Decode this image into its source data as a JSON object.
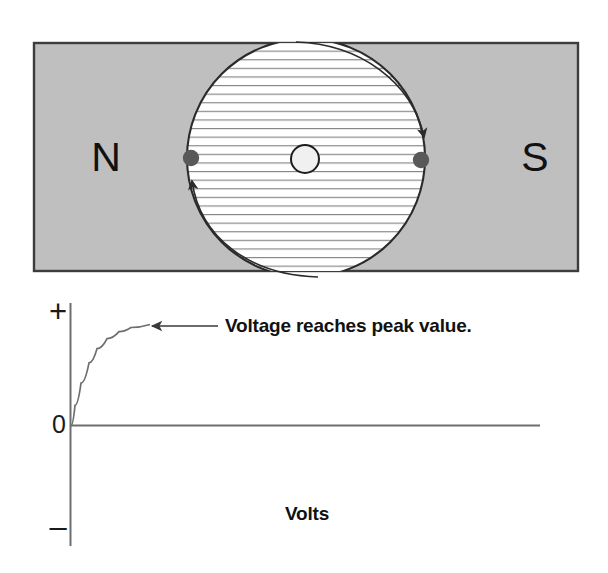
{
  "figure": {
    "title_text": "",
    "magnet": {
      "north_label": "N",
      "south_label": "S",
      "body_color": "#bfbfbf",
      "border_color": "#3c3c3c",
      "gap_fill": "#ffffff",
      "hatch_color": "#7a7a7a"
    },
    "armature": {
      "core_label": "",
      "core_fill": "#f0f0f0",
      "core_stroke": "#1a1a1a",
      "coil_dot_color": "#595959",
      "left_dot_label": "",
      "right_dot_label": ""
    },
    "rotation_arrows": {
      "top_arrow_label": "",
      "bottom_arrow_label": "",
      "color": "#2b2b2b"
    }
  },
  "chart_data": {
    "type": "line",
    "title": "",
    "subtitle": "",
    "xlabel": "",
    "ylabel": "Volts",
    "axis_labels": {
      "positive": "+",
      "zero": "0",
      "negative": "–"
    },
    "ylim": [
      -1,
      1
    ],
    "xlim": [
      0,
      1
    ],
    "grid": false,
    "legend": null,
    "axis_color": "#6e6e6e",
    "series": [
      {
        "name": "Voltage",
        "color": "#6e6e6e",
        "x": [
          0.0,
          0.02,
          0.05,
          0.09,
          0.13,
          0.18,
          0.24,
          0.3,
          0.4,
          0.5,
          0.6,
          0.75,
          1.0
        ],
        "y": [
          0.0,
          0.2,
          0.42,
          0.62,
          0.76,
          0.86,
          0.93,
          0.97,
          1.0,
          1.0,
          1.0,
          1.0,
          1.0
        ]
      }
    ],
    "annotations": [
      {
        "text": "Voltage reaches peak value.",
        "points_to_x": 0.3,
        "points_to_y": 1.0,
        "arrow": "left"
      }
    ]
  }
}
